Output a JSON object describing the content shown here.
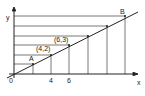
{
  "diagram": {
    "axes": {
      "x_label": "x",
      "y_label": "y",
      "origin_label": "0"
    },
    "x_tick_labels": [
      "4",
      "6"
    ],
    "points": [
      {
        "name": "A",
        "label": "A"
      },
      {
        "name": "p42",
        "label": "(4,2)"
      },
      {
        "name": "p63",
        "label": "(6,3)"
      },
      {
        "name": "B",
        "label": "B"
      }
    ],
    "line_color": "#222222",
    "grid_line_color": "#555555",
    "line_equation": "y = x/2",
    "grid_points": [
      [
        2,
        1
      ],
      [
        4,
        2
      ],
      [
        6,
        3
      ],
      [
        8,
        4
      ],
      [
        10,
        5
      ],
      [
        12,
        6
      ]
    ]
  }
}
